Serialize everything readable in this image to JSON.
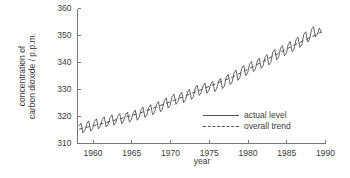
{
  "chart_data": {
    "type": "line",
    "title": "",
    "xlabel": "year",
    "ylabel_line1": "concentration of",
    "ylabel_line2": "carbon dioxide / p.p.m.",
    "xlim": [
      1958,
      1990
    ],
    "ylim": [
      310,
      360
    ],
    "xticks": [
      1960,
      1965,
      1970,
      1975,
      1980,
      1985,
      1990
    ],
    "yticks": [
      310,
      320,
      330,
      340,
      350,
      360
    ],
    "xtick_labels": [
      "1960",
      "1965",
      "1970",
      "1975",
      "1980",
      "1985",
      "1990"
    ],
    "ytick_labels": [
      "310",
      "320",
      "330",
      "340",
      "350",
      "360"
    ],
    "grid": false,
    "legend_position": "inside-lower-right",
    "line_color": "#555555",
    "axis_color": "#777777",
    "series": [
      {
        "name": "actual level",
        "style": "solid",
        "color": "#555555",
        "description": "monthly mean CO2 with seasonal oscillation, amplitude about 6 p.p.m.",
        "x": [
          1958.2,
          1958.45,
          1958.7,
          1958.95,
          1959.2,
          1959.45,
          1959.7,
          1959.95,
          1960.2,
          1960.45,
          1960.7,
          1960.95,
          1961.2,
          1961.45,
          1961.7,
          1961.95,
          1962.2,
          1962.45,
          1962.7,
          1962.95,
          1963.2,
          1963.45,
          1963.7,
          1963.95,
          1964.2,
          1964.45,
          1964.7,
          1964.95,
          1965.2,
          1965.45,
          1965.7,
          1965.95,
          1966.2,
          1966.45,
          1966.7,
          1966.95,
          1967.2,
          1967.45,
          1967.7,
          1967.95,
          1968.2,
          1968.45,
          1968.7,
          1968.95,
          1969.2,
          1969.45,
          1969.7,
          1969.95,
          1970.2,
          1970.45,
          1970.7,
          1970.95,
          1971.2,
          1971.45,
          1971.7,
          1971.95,
          1972.2,
          1972.45,
          1972.7,
          1972.95,
          1973.2,
          1973.45,
          1973.7,
          1973.95,
          1974.2,
          1974.45,
          1974.7,
          1974.95,
          1975.2,
          1975.45,
          1975.7,
          1975.95,
          1976.2,
          1976.45,
          1976.7,
          1976.95,
          1977.2,
          1977.45,
          1977.7,
          1977.95,
          1978.2,
          1978.45,
          1978.7,
          1978.95,
          1979.2,
          1979.45,
          1979.7,
          1979.95,
          1980.2,
          1980.45,
          1980.7,
          1980.95,
          1981.2,
          1981.45,
          1981.7,
          1981.95,
          1982.2,
          1982.45,
          1982.7,
          1982.95,
          1983.2,
          1983.45,
          1983.7,
          1983.95,
          1984.2,
          1984.45,
          1984.7,
          1984.95,
          1985.2,
          1985.45,
          1985.7,
          1985.95,
          1986.2,
          1986.45,
          1986.7,
          1986.95,
          1987.2,
          1987.45,
          1987.7,
          1987.95,
          1988.2,
          1988.45,
          1988.7,
          1988.95,
          1989.2,
          1989.45
        ],
        "y": [
          316.5,
          317.5,
          313.9,
          314.9,
          317.4,
          318.4,
          314.6,
          315.6,
          318.2,
          319.2,
          315.4,
          316.4,
          318.9,
          319.9,
          316.1,
          317.1,
          319.6,
          320.6,
          316.8,
          317.8,
          320.1,
          321.1,
          317.3,
          318.3,
          320.6,
          321.6,
          317.9,
          318.9,
          321.4,
          322.4,
          318.6,
          319.6,
          322.5,
          323.5,
          319.7,
          320.7,
          323.4,
          324.4,
          320.6,
          321.6,
          324.5,
          325.5,
          321.7,
          322.7,
          325.9,
          326.9,
          323.1,
          324.1,
          327.3,
          328.3,
          324.5,
          325.5,
          328.0,
          329.0,
          325.2,
          326.2,
          329.1,
          330.1,
          326.3,
          327.3,
          330.6,
          331.6,
          327.8,
          328.8,
          331.4,
          332.4,
          328.6,
          329.6,
          332.0,
          333.0,
          329.2,
          330.2,
          333.1,
          334.1,
          330.3,
          331.3,
          334.6,
          335.6,
          331.8,
          332.8,
          336.2,
          337.2,
          333.4,
          334.4,
          337.9,
          338.9,
          335.1,
          336.1,
          339.4,
          340.4,
          336.6,
          337.6,
          340.6,
          341.6,
          337.8,
          338.8,
          341.9,
          342.9,
          339.1,
          340.1,
          343.8,
          344.8,
          341.0,
          342.0,
          345.3,
          346.3,
          342.5,
          343.5,
          346.8,
          347.8,
          344.0,
          345.0,
          348.4,
          349.4,
          345.6,
          346.6,
          350.4,
          351.4,
          347.6,
          348.6,
          352.3,
          353.3,
          349.5,
          350.5,
          352.8,
          351.2
        ]
      },
      {
        "name": "overall trend",
        "style": "dashed",
        "color": "#555555",
        "description": "smooth rising trend underlying the seasonal oscillation",
        "x": [
          1958.2,
          1962,
          1966,
          1970,
          1974,
          1978,
          1982,
          1986,
          1989.5
        ],
        "y": [
          315.3,
          318.0,
          321.2,
          325.5,
          330.0,
          334.6,
          340.5,
          346.5,
          351.3
        ]
      }
    ]
  },
  "legend": {
    "items": [
      {
        "label": "actual level",
        "style": "solid"
      },
      {
        "label": "overall trend",
        "style": "dashed"
      }
    ]
  }
}
